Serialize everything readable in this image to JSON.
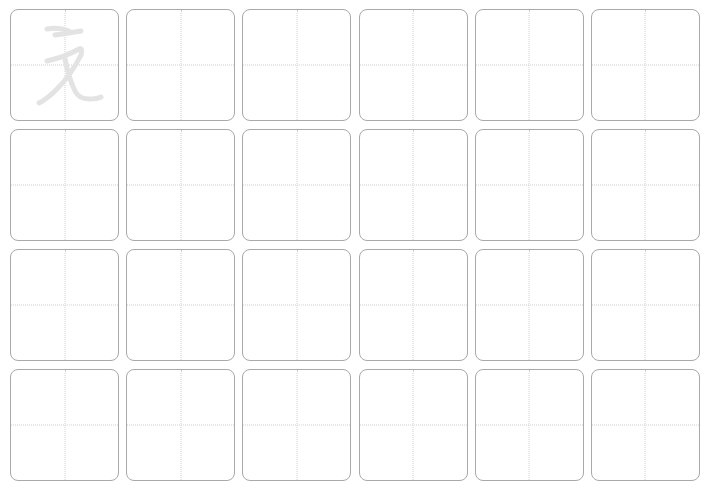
{
  "sheet": {
    "type": "tianzige-practice-grid",
    "rows": 4,
    "columns": 6,
    "border_color": "#a9a9a9",
    "guide_color": "#cfcfcf",
    "glyph_color": "#e3e3e3",
    "trace_glyph": {
      "character": "无",
      "style": "cursive",
      "cell_row": 0,
      "cell_col": 0
    }
  }
}
